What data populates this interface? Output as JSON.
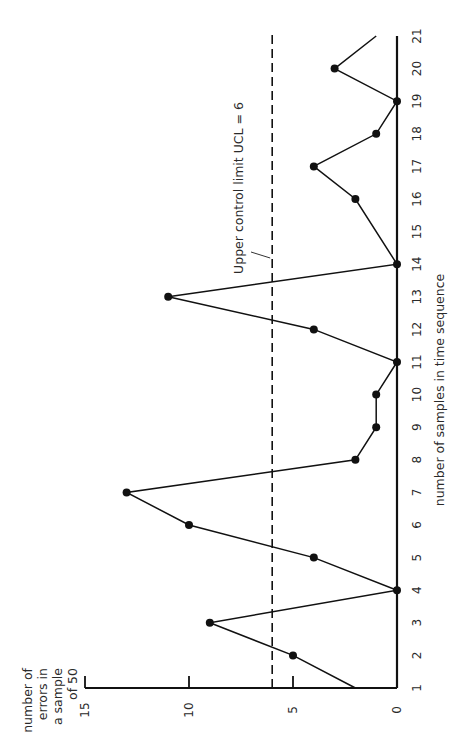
{
  "chart_data": {
    "type": "line",
    "orientation": "rotated-90-ccw",
    "title": "",
    "xlabel": "number of samples in time sequence",
    "ylabel": "number of errors in a sample of 50",
    "ylabel_lines": [
      "number of",
      "errors in",
      "a sample",
      "of 50"
    ],
    "x_ticks": [
      1,
      2,
      3,
      4,
      5,
      6,
      7,
      8,
      9,
      10,
      11,
      12,
      13,
      14,
      15,
      16,
      17,
      18,
      19,
      20,
      21
    ],
    "y_ticks": [
      0,
      5,
      10,
      15
    ],
    "xlim": [
      1,
      21
    ],
    "ylim": [
      0,
      15
    ],
    "grid": false,
    "series": [
      {
        "name": "errors",
        "points": [
          {
            "x": 1,
            "y": 2,
            "marker": false
          },
          {
            "x": 2,
            "y": 5,
            "marker": true
          },
          {
            "x": 3,
            "y": 9,
            "marker": true
          },
          {
            "x": 4,
            "y": 0,
            "marker": true
          },
          {
            "x": 5,
            "y": 4,
            "marker": true
          },
          {
            "x": 6,
            "y": 10,
            "marker": true
          },
          {
            "x": 7,
            "y": 13,
            "marker": true
          },
          {
            "x": 8,
            "y": 2,
            "marker": true
          },
          {
            "x": 9,
            "y": 1,
            "marker": true
          },
          {
            "x": 10,
            "y": 1,
            "marker": true
          },
          {
            "x": 11,
            "y": 0,
            "marker": true
          },
          {
            "x": 12,
            "y": 4,
            "marker": true
          },
          {
            "x": 13,
            "y": 11,
            "marker": true
          },
          {
            "x": 14,
            "y": 0,
            "marker": true
          },
          {
            "x": 16,
            "y": 2,
            "marker": true
          },
          {
            "x": 17,
            "y": 4,
            "marker": true
          },
          {
            "x": 18,
            "y": 1,
            "marker": true
          },
          {
            "x": 19,
            "y": 0,
            "marker": true
          },
          {
            "x": 20,
            "y": 3,
            "marker": true
          },
          {
            "x": 21,
            "y": 1,
            "marker": false
          }
        ]
      }
    ],
    "reference_lines": [
      {
        "type": "horizontal",
        "y": 6,
        "style": "dashed",
        "label": "Upper control limit UCL = 6"
      }
    ]
  },
  "labels": {
    "ucl": "Upper control limit UCL = 6",
    "xlabel": "number of samples in time sequence",
    "ylabel_lines": [
      "number of",
      "errors in",
      "a sample",
      "of 50"
    ]
  }
}
